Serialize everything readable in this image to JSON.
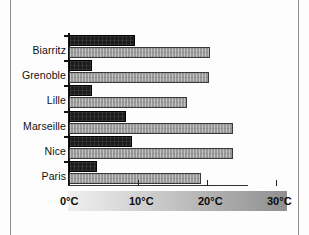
{
  "chart_data": {
    "type": "bar",
    "orientation": "horizontal",
    "title": "",
    "xlabel": "",
    "ylabel": "",
    "categories": [
      "Biarritz",
      "Grenoble",
      "Lille",
      "Marseille",
      "Nice",
      "Paris"
    ],
    "series": [
      {
        "name": "minimum",
        "color": "#1b1b1b",
        "values": [
          9.5,
          3.3,
          3.3,
          8.3,
          9.1,
          4.0
        ]
      },
      {
        "name": "maximum",
        "color": "#9a9a9a",
        "values": [
          20.4,
          20.3,
          17.1,
          23.7,
          23.7,
          19.1
        ]
      }
    ],
    "xlim": [
      0,
      31.7
    ],
    "xticks": [
      0,
      10,
      20,
      30
    ],
    "xtick_labels": [
      "0°C",
      "10°C",
      "20°C",
      "30°C"
    ],
    "grid": false,
    "legend": "none",
    "units": "°C"
  },
  "axis": {
    "tick_0": "0°C",
    "tick_10": "10°C",
    "tick_20": "20°C",
    "tick_30": "30°C"
  }
}
